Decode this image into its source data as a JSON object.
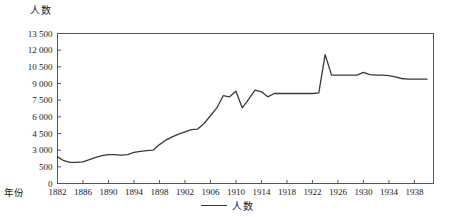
{
  "chart_data": {
    "type": "line",
    "title": "",
    "ylabel": "人数",
    "xlabel": "年份",
    "ylim": [
      0,
      13500
    ],
    "xlim": [
      1882,
      1941
    ],
    "grid": false,
    "legend_position": "bottom",
    "series": [
      {
        "name": "人数",
        "color": "#3a3a3a",
        "x": [
          1882,
          1883,
          1884,
          1885,
          1886,
          1887,
          1888,
          1889,
          1890,
          1891,
          1892,
          1893,
          1894,
          1895,
          1896,
          1897,
          1898,
          1899,
          1900,
          1901,
          1902,
          1903,
          1904,
          1905,
          1906,
          1907,
          1908,
          1909,
          1910,
          1911,
          1912,
          1913,
          1914,
          1915,
          1916,
          1917,
          1918,
          1919,
          1920,
          1921,
          1922,
          1923,
          1924,
          1925,
          1926,
          1927,
          1928,
          1929,
          1930,
          1931,
          1932,
          1933,
          1934,
          1935,
          1936,
          1937,
          1938,
          1939,
          1940
        ],
        "values": [
          2400,
          2050,
          1900,
          1900,
          1950,
          2150,
          2350,
          2500,
          2600,
          2600,
          2550,
          2600,
          2800,
          2900,
          2950,
          3000,
          3500,
          3900,
          4200,
          4450,
          4650,
          4850,
          4900,
          5400,
          6100,
          6800,
          7900,
          7800,
          8300,
          6800,
          7600,
          8400,
          8250,
          7800,
          8100,
          8100,
          8100,
          8100,
          8100,
          8100,
          8100,
          8150,
          11600,
          9750,
          9750,
          9750,
          9750,
          9750,
          10000,
          9800,
          9750,
          9750,
          9700,
          9600,
          9450,
          9400,
          9400,
          9400,
          9400
        ]
      }
    ],
    "ytick_labels": [
      "0",
      "500",
      "3 000",
      "4 500",
      "6 000",
      "7 500",
      "9 000",
      "10 500",
      "12 000",
      "13 500"
    ],
    "ytick_values": [
      0,
      1500,
      3000,
      4500,
      6000,
      7500,
      9000,
      10500,
      12000,
      13500
    ],
    "xtick_labels": [
      "1882",
      "1886",
      "1890",
      "1894",
      "1898",
      "1902",
      "1906",
      "1910",
      "1914",
      "1918",
      "1922",
      "1926",
      "1930",
      "1934",
      "1938"
    ],
    "xtick_values": [
      1882,
      1886,
      1890,
      1894,
      1898,
      1902,
      1906,
      1910,
      1914,
      1918,
      1922,
      1926,
      1930,
      1934,
      1938
    ]
  },
  "legend": {
    "entry_label": "人数"
  },
  "axis_titles": {
    "y": "人数",
    "x": "年份"
  },
  "colors": {
    "line": "#3a3a3a",
    "frame": "#555555",
    "text": "#1a1a1a"
  }
}
